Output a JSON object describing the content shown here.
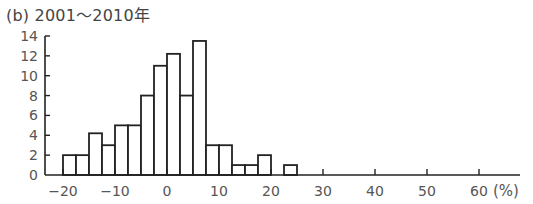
{
  "figure": {
    "panel_label": "(b)",
    "title": "2001〜2010年",
    "unit_label": "(%)"
  },
  "chart_data": {
    "type": "bar",
    "subtype": "histogram",
    "title": "(b) 2001〜2010年",
    "xlabel": "(%)",
    "ylabel": "",
    "bin_width": 2.5,
    "bin_edges": [
      -20,
      -17.5,
      -15,
      -12.5,
      -10,
      -7.5,
      -5,
      -2.5,
      0,
      2.5,
      5,
      7.5,
      10,
      12.5,
      15,
      17.5,
      20,
      22.5,
      25
    ],
    "values": [
      2,
      2,
      4.2,
      3,
      5,
      5,
      8,
      11,
      12.2,
      8,
      13.5,
      3,
      3,
      1,
      1,
      2,
      0,
      1
    ],
    "xlim": [
      -21,
      68
    ],
    "ylim": [
      0,
      14
    ],
    "xticks": [
      -20,
      -10,
      0,
      10,
      20,
      30,
      40,
      50,
      60
    ],
    "xtick_labels": [
      "−20",
      "−10",
      "0",
      "10",
      "20",
      "30",
      "40",
      "50",
      "60"
    ],
    "yticks": [
      0,
      2,
      4,
      6,
      8,
      10,
      12,
      14
    ],
    "ytick_labels": [
      "0",
      "2",
      "4",
      "6",
      "8",
      "10",
      "12",
      "14"
    ],
    "grid": false,
    "legend": null,
    "colors": {
      "bar_fill": "#ffffff",
      "bar_stroke": "#222222",
      "axis": "#222222",
      "text": "#555555"
    }
  }
}
